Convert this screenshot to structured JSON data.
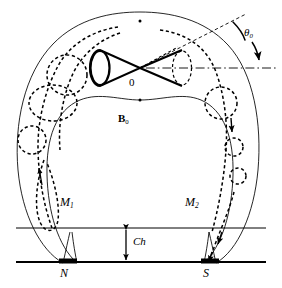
{
  "figure": {
    "kind": "magnetosphere-cross-section-diagram",
    "background_color": "#ffffff",
    "ink_color": "#000000",
    "width": 282,
    "height": 288
  },
  "labels": {
    "tilt_angle": "θ",
    "tilt_angle_sub": "0",
    "origin": "0",
    "field_symbol": "B",
    "field_symbol_sub": "0",
    "mirror_point_1": "M",
    "mirror_point_1_sub": "1",
    "mirror_point_2": "M",
    "mirror_point_2_sub": "2",
    "height": "Ch",
    "north_pole": "N",
    "south_pole": "S"
  },
  "elements": {
    "outer_boundary_name": "outer-magnetopause-arc",
    "inner_boundary_name": "inner-cavity-arc",
    "cone_name": "double-cone-loss-cone",
    "axis_name": "dash-dot-symmetry-axis",
    "tilt_line_name": "dashed-tilt-axis",
    "angle_arc_name": "tilt-angle-arc-arrow",
    "vortex_band_name": "dashed-vortex-band",
    "ground_line_name": "ground-baseline",
    "ionosphere_line_name": "ionosphere-line",
    "height_arrow_name": "ch-height-double-arrow",
    "north_pole_marker_name": "north-pole-marker",
    "south_pole_marker_name": "south-pole-marker"
  }
}
